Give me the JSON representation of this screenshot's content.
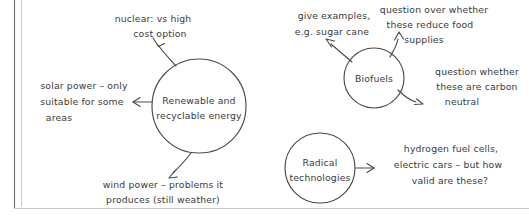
{
  "page": {
    "kind": "hand-drawn-mind-map",
    "background_color": "#ffffff",
    "ink_color": "#4a4a4d",
    "text_color": "#3a3a3c",
    "frame_color": "#6b6b6e"
  },
  "nodes": [
    {
      "id": "renewable",
      "label_line1": "Renewable and",
      "label_line2": "recyclable energy",
      "cx": 199,
      "cy": 106,
      "r": 47
    },
    {
      "id": "biofuels",
      "label_line1": "Biofuels",
      "label_line2": "",
      "cx": 374,
      "cy": 78,
      "r": 30
    },
    {
      "id": "radical",
      "label_line1": "Radical",
      "label_line2": "technologies",
      "cx": 320,
      "cy": 168,
      "r": 35
    }
  ],
  "annotations": [
    {
      "id": "nuclear",
      "source": "renewable",
      "lines": [
        "nuclear: vs high",
        "cost option"
      ],
      "align": "middle",
      "x": 153,
      "y": 22
    },
    {
      "id": "solar",
      "source": "renewable",
      "lines": [
        "solar power – only",
        "suitable for some",
        "areas"
      ],
      "align": "middle",
      "x": 84,
      "y": 89
    },
    {
      "id": "wind",
      "source": "renewable",
      "lines": [
        "wind power – problems it",
        "produces (still weather)"
      ],
      "align": "middle",
      "x": 163,
      "y": 188
    },
    {
      "id": "examples",
      "source": "biofuels",
      "lines": [
        "give examples,",
        "e.g. sugar cane"
      ],
      "align": "middle",
      "x": 334,
      "y": 19
    },
    {
      "id": "food-supplies",
      "source": "biofuels",
      "lines": [
        "question over whether",
        "these reduce food",
        "supplies"
      ],
      "align": "middle",
      "x": 434,
      "y": 13
    },
    {
      "id": "carbon-neutral",
      "source": "biofuels",
      "lines": [
        "question whether",
        "these are carbon",
        "neutral"
      ],
      "align": "middle",
      "x": 475,
      "y": 75
    },
    {
      "id": "hydrogen",
      "source": "radical",
      "lines": [
        "hydrogen fuel cells,",
        "electric cars – but how",
        "valid are these?"
      ],
      "align": "middle",
      "x": 451,
      "y": 152
    }
  ],
  "connectors": [
    {
      "id": "renewable-to-nuclear",
      "from": "renewable",
      "to": "nuclear"
    },
    {
      "id": "renewable-to-solar",
      "from": "renewable",
      "to": "solar"
    },
    {
      "id": "renewable-to-wind",
      "from": "renewable",
      "to": "wind"
    },
    {
      "id": "biofuels-to-examples",
      "from": "biofuels",
      "to": "examples"
    },
    {
      "id": "biofuels-to-food-supplies",
      "from": "biofuels",
      "to": "food-supplies"
    },
    {
      "id": "biofuels-to-carbon-neutral",
      "from": "biofuels",
      "to": "carbon-neutral"
    },
    {
      "id": "radical-to-hydrogen",
      "from": "radical",
      "to": "hydrogen"
    }
  ]
}
